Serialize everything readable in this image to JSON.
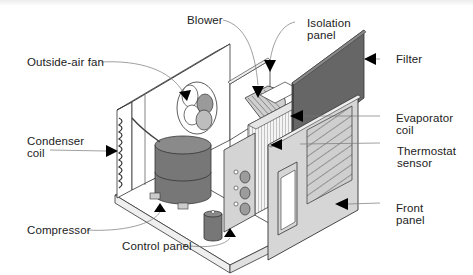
{
  "diagram": {
    "colors": {
      "line": "#333333",
      "dark_fill": "#6e6e6e",
      "mid_fill": "#9a9a9a",
      "light_fill": "#c9c9c9",
      "panel_fill": "#d4d4d4",
      "arrow": "#000000"
    },
    "labels": {
      "blower": "Blower",
      "isolation_panel": "Isolation\npanel",
      "outside_air_fan": "Outside-air fan",
      "filter": "Filter",
      "condenser_coil": "Condenser\ncoil",
      "evaporator_coil": "Evaporator\ncoil",
      "thermostat_sensor": "Thermostat\nsensor",
      "compressor": "Compressor",
      "front_panel": "Front\npanel",
      "control_panel": "Control panel"
    }
  }
}
